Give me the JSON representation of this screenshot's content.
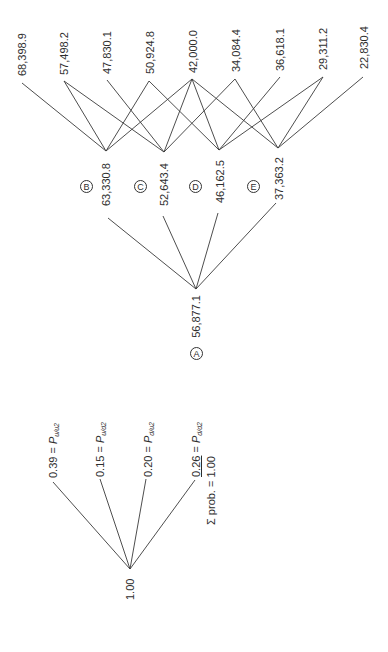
{
  "left_tree": {
    "root_label": "1.00",
    "branches": [
      {
        "value": "0.39",
        "eq": " = ",
        "p": "P",
        "sub": "u/u2"
      },
      {
        "value": "0.15",
        "eq": " = ",
        "p": "P",
        "sub": "u/d2"
      },
      {
        "value": "0.20",
        "eq": " = ",
        "p": "P",
        "sub": "d/u2"
      },
      {
        "value": "0.26",
        "eq": " = ",
        "p": "P",
        "sub": "d/d2"
      }
    ],
    "sum_label": "Σ prob. = 1.00"
  },
  "right_tree": {
    "root": {
      "letter": "A",
      "value": "56,877.1"
    },
    "mid_nodes": [
      {
        "letter": "B",
        "value": "63,330.8"
      },
      {
        "letter": "C",
        "value": "52,643.4"
      },
      {
        "letter": "D",
        "value": "46,162.5"
      },
      {
        "letter": "E",
        "value": "37,363.2"
      }
    ],
    "leaves": [
      {
        "value": "68,398.9",
        "connects": [
          "B"
        ]
      },
      {
        "value": "57,498.2",
        "connects": [
          "B",
          "C"
        ]
      },
      {
        "value": "47,830.1",
        "connects": [
          "C"
        ]
      },
      {
        "value": "50,924.8",
        "connects": [
          "B",
          "D"
        ]
      },
      {
        "value": "42,000.0",
        "connects": [
          "B",
          "C",
          "D",
          "E"
        ]
      },
      {
        "value": "34,084.4",
        "connects": [
          "C",
          "E"
        ]
      },
      {
        "value": "36,618.1",
        "connects": [
          "D"
        ]
      },
      {
        "value": "29,311.2",
        "connects": [
          "D",
          "E"
        ]
      },
      {
        "value": "22,830.4",
        "connects": [
          "E"
        ]
      }
    ]
  }
}
